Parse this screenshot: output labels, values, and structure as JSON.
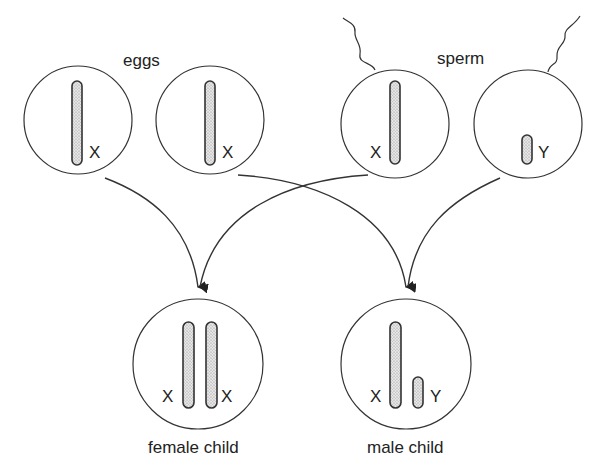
{
  "diagram": {
    "type": "sex-chromosome inheritance",
    "colors": {
      "line": "#333333",
      "chromosome_fill": "#d9d9d9",
      "background": "#ffffff"
    },
    "groups": {
      "eggs": {
        "label": "eggs"
      },
      "sperm": {
        "label": "sperm"
      }
    },
    "cells": [
      {
        "id": "egg-1",
        "kind": "egg",
        "chromosomes": [
          {
            "type": "X",
            "label": "X"
          }
        ]
      },
      {
        "id": "egg-2",
        "kind": "egg",
        "chromosomes": [
          {
            "type": "X",
            "label": "X"
          }
        ]
      },
      {
        "id": "sperm-1",
        "kind": "sperm",
        "chromosomes": [
          {
            "type": "X",
            "label": "X"
          }
        ]
      },
      {
        "id": "sperm-2",
        "kind": "sperm",
        "chromosomes": [
          {
            "type": "Y",
            "label": "Y"
          }
        ]
      }
    ],
    "children": [
      {
        "id": "female",
        "label": "female child",
        "chromosomes": [
          {
            "label": "X"
          },
          {
            "label": "X"
          }
        ]
      },
      {
        "id": "male",
        "label": "male child",
        "chromosomes": [
          {
            "label": "X"
          },
          {
            "label": "Y"
          }
        ]
      }
    ],
    "arrows": [
      {
        "from": "egg-1",
        "to": "female"
      },
      {
        "from": "sperm-1",
        "to": "female"
      },
      {
        "from": "egg-2",
        "to": "male"
      },
      {
        "from": "sperm-2",
        "to": "male"
      }
    ]
  }
}
